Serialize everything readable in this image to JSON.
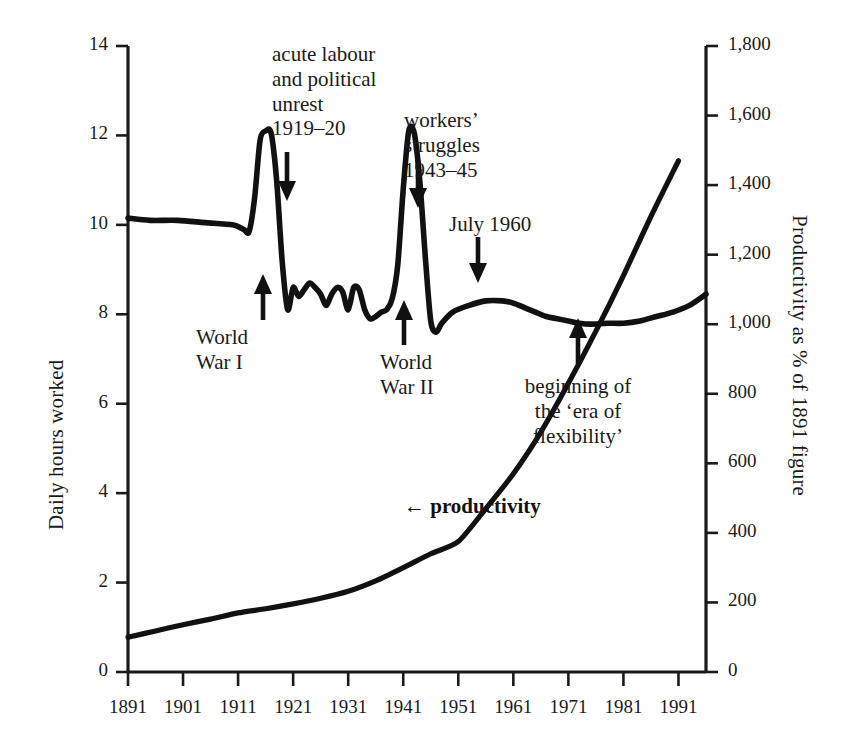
{
  "figure": {
    "width": 847,
    "height": 748,
    "background": "#ffffff",
    "ink": "#1a1a1a"
  },
  "axes": {
    "left": {
      "title": "Daily hours worked",
      "ticks": [
        "0",
        "2",
        "4",
        "6",
        "8",
        "10",
        "12",
        "14"
      ],
      "values": [
        0,
        2,
        4,
        6,
        8,
        10,
        12,
        14
      ],
      "range": [
        0,
        14
      ]
    },
    "right": {
      "title": "Productivity as % of 1891 figure",
      "ticks": [
        "0",
        "200",
        "400",
        "600",
        "800",
        "1,000",
        "1,200",
        "1,400",
        "1,600",
        "1,800"
      ],
      "values": [
        0,
        200,
        400,
        600,
        800,
        1000,
        1200,
        1400,
        1600,
        1800
      ],
      "range": [
        0,
        1800
      ]
    },
    "bottom": {
      "title": "",
      "ticks": [
        "1891",
        "1901",
        "1911",
        "1921",
        "1931",
        "1941",
        "1951",
        "1961",
        "1971",
        "1981",
        "1991"
      ],
      "values": [
        1891,
        1901,
        1911,
        1921,
        1931,
        1941,
        1951,
        1961,
        1971,
        1981,
        1991
      ],
      "range": [
        1891,
        1996
      ]
    }
  },
  "annotations": [
    {
      "name": "acute-labour-unrest",
      "lines": [
        "acute labour",
        "and political",
        "unrest",
        "1919–20"
      ],
      "arrow": "down",
      "align": "left"
    },
    {
      "name": "workers-struggles",
      "lines": [
        "workers’",
        "struggles",
        "1943–45"
      ],
      "arrow": "down",
      "align": "left"
    },
    {
      "name": "july-1960",
      "lines": [
        "July 1960"
      ],
      "arrow": "down",
      "align": "left"
    },
    {
      "name": "world-war-one",
      "lines": [
        "World",
        "War I"
      ],
      "arrow": "up",
      "align": "left"
    },
    {
      "name": "world-war-two",
      "lines": [
        "World",
        "War II"
      ],
      "arrow": "up",
      "align": "left"
    },
    {
      "name": "era-of-flexibility",
      "lines": [
        "beginning of",
        "the ‘era of",
        "flexibility’"
      ],
      "arrow": "up",
      "align": "center"
    }
  ],
  "series_label": {
    "productivity": "← productivity"
  },
  "chart_data": {
    "type": "line",
    "title": "",
    "subtitle": "",
    "xlabel": "",
    "ylabel": "Daily hours worked",
    "y2label": "Productivity as % of 1891 figure",
    "xlim": [
      1891,
      1996
    ],
    "ylim": [
      0,
      14
    ],
    "y2lim": [
      0,
      1800
    ],
    "grid": false,
    "legend": "inline-annotations",
    "xticks": [
      1891,
      1901,
      1911,
      1921,
      1931,
      1941,
      1951,
      1961,
      1971,
      1981,
      1991
    ],
    "xticklabels": [
      "1891",
      "1901",
      "1911",
      "1921",
      "1931",
      "1941",
      "1951",
      "1961",
      "1971",
      "1981",
      "1991"
    ],
    "yticks": [
      0,
      2,
      4,
      6,
      8,
      10,
      12,
      14
    ],
    "yticklabels": [
      "0",
      "2",
      "4",
      "6",
      "8",
      "10",
      "12",
      "14"
    ],
    "y2ticks": [
      0,
      200,
      400,
      600,
      800,
      1000,
      1200,
      1400,
      1600,
      1800
    ],
    "y2ticklabels": [
      "0",
      "200",
      "400",
      "600",
      "800",
      "1,000",
      "1,200",
      "1,400",
      "1,600",
      "1,800"
    ],
    "series": [
      {
        "name": "Daily hours worked",
        "axis": "left",
        "units": "hours per day",
        "x": [
          1891,
          1895,
          1900,
          1905,
          1910,
          1912,
          1913,
          1914,
          1915,
          1916,
          1917,
          1918,
          1919,
          1920,
          1921,
          1922,
          1923,
          1924,
          1925,
          1926,
          1927,
          1928,
          1929,
          1930,
          1931,
          1932,
          1933,
          1934,
          1935,
          1936,
          1937,
          1938,
          1939,
          1940,
          1941,
          1942,
          1943,
          1944,
          1945,
          1946,
          1947,
          1948,
          1950,
          1953,
          1956,
          1959,
          1961,
          1963,
          1965,
          1967,
          1969,
          1971,
          1973,
          1975,
          1978,
          1981,
          1984,
          1987,
          1990,
          1993,
          1996
        ],
        "y": [
          10.15,
          10.1,
          10.1,
          10.05,
          10.0,
          9.9,
          9.85,
          10.6,
          11.9,
          12.1,
          12.05,
          11.0,
          9.2,
          8.1,
          8.6,
          8.4,
          8.55,
          8.7,
          8.6,
          8.45,
          8.2,
          8.45,
          8.6,
          8.5,
          8.1,
          8.6,
          8.55,
          8.1,
          7.9,
          7.95,
          8.05,
          8.1,
          8.35,
          9.1,
          10.8,
          12.1,
          12.05,
          11.0,
          9.3,
          7.85,
          7.6,
          7.8,
          8.05,
          8.2,
          8.3,
          8.3,
          8.25,
          8.15,
          8.05,
          7.95,
          7.9,
          7.85,
          7.8,
          7.78,
          7.8,
          7.8,
          7.85,
          7.95,
          8.05,
          8.2,
          8.45
        ]
      },
      {
        "name": "Productivity as % of 1891 figure",
        "axis": "right",
        "units": "% of 1891 figure",
        "x": [
          1891,
          1896,
          1901,
          1906,
          1911,
          1916,
          1921,
          1926,
          1931,
          1936,
          1941,
          1946,
          1951,
          1956,
          1961,
          1966,
          1971,
          1976,
          1981,
          1986,
          1991
        ],
        "y": [
          100,
          118,
          136,
          152,
          170,
          182,
          196,
          212,
          232,
          262,
          300,
          340,
          375,
          470,
          570,
          690,
          830,
          980,
          1140,
          1310,
          1470
        ]
      }
    ],
    "events": [
      {
        "label": "World War I",
        "year_range": [
          1914,
          1918
        ],
        "arrow": "up"
      },
      {
        "label": "acute labour and political unrest 1919–20",
        "year_range": [
          1919,
          1920
        ],
        "arrow": "down"
      },
      {
        "label": "World War II",
        "year_range": [
          1939,
          1945
        ],
        "arrow": "up"
      },
      {
        "label": "workers’ struggles 1943–45",
        "year_range": [
          1943,
          1945
        ],
        "arrow": "down"
      },
      {
        "label": "July 1960",
        "year_range": [
          1960,
          1960
        ],
        "arrow": "down"
      },
      {
        "label": "beginning of the ‘era of flexibility’",
        "year_range": [
          1980,
          1980
        ],
        "arrow": "up"
      }
    ]
  }
}
